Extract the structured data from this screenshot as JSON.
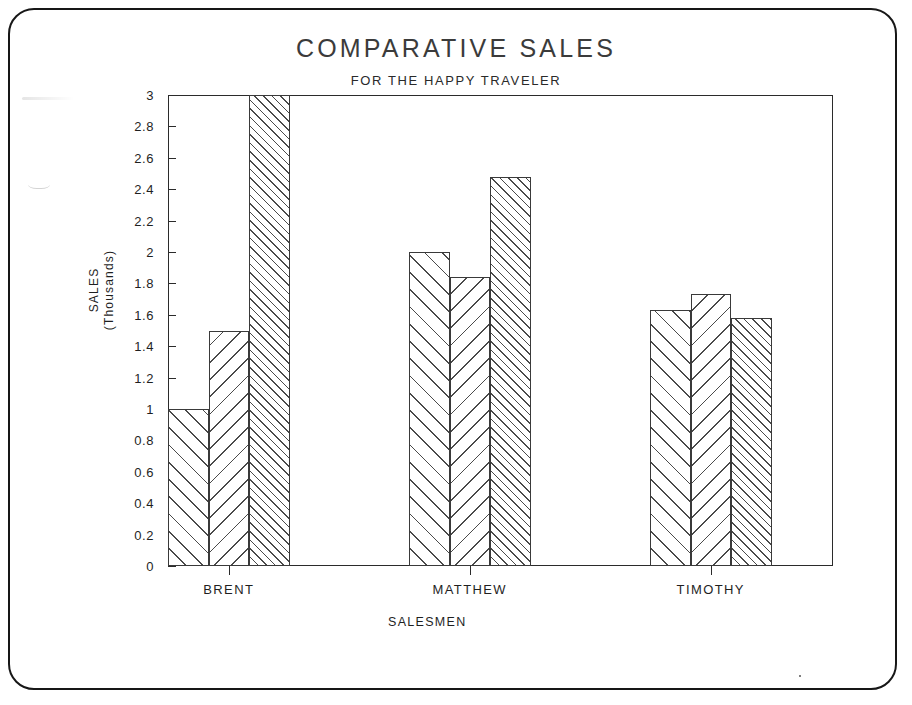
{
  "chart_data": {
    "type": "bar",
    "title": "COMPARATIVE SALES",
    "subtitle": "FOR THE HAPPY TRAVELER",
    "xlabel": "SALESMEN",
    "ylabel": "SALES\n(Thousands)",
    "ylabel_line1": "SALES",
    "ylabel_line2": "(Thousands)",
    "grid": false,
    "legend_position": "bottom",
    "ylim": [
      0,
      3
    ],
    "ytick_labels": [
      "0",
      "0.2",
      "0.4",
      "0.6",
      "0.8",
      "1",
      "1.2",
      "1.4",
      "1.6",
      "1.8",
      "2",
      "2.2",
      "2.4",
      "2.6",
      "2.8",
      "3"
    ],
    "ytick_values": [
      0,
      0.2,
      0.4,
      0.6,
      0.8,
      1,
      1.2,
      1.4,
      1.6,
      1.8,
      2,
      2.2,
      2.4,
      2.6,
      2.8,
      3
    ],
    "categories": [
      "BRENT",
      "MATTHEW",
      "TIMOTHY"
    ],
    "series": [
      {
        "name": "PORTLAND",
        "hatch": "forward-slash",
        "values": [
          1.0,
          2.0,
          1.63
        ]
      },
      {
        "name": "DENVER",
        "hatch": "back-slash",
        "values": [
          1.5,
          1.84,
          1.73
        ]
      },
      {
        "name": "LOS ANGELES",
        "hatch": "dense-forward-slash",
        "values": [
          3.0,
          2.48,
          1.58
        ]
      }
    ]
  },
  "legend": {
    "title": "SALESMEN",
    "items": [
      {
        "label": "PORTLAND"
      },
      {
        "label": "DENVER"
      },
      {
        "label": "LOS ANGELES"
      }
    ]
  },
  "colors": {
    "frame": "#171717",
    "axis": "#2b2b2b",
    "hatch": "#4a4a4a",
    "background": "#ffffff",
    "title_text": "#3b3b3b",
    "body_text": "#1f1f1f"
  }
}
